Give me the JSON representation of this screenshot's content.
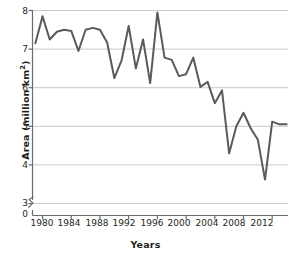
{
  "chart_data": {
    "type": "line",
    "title": "",
    "xlabel": "Years",
    "ylabel": "Area (million km²)",
    "ylabel_text": "Area (million km",
    "ylabel_sup": "2",
    "ylabel_tail": ")",
    "xlim": [
      1978.6,
      2014.2
    ],
    "ylim": [
      3.0,
      8.0
    ],
    "y_axis_break": true,
    "y_break_labels": [
      "3",
      "0"
    ],
    "grid": true,
    "grid_axis": "y",
    "legend": "none",
    "line_color": "#5a5a5a",
    "grid_color": "#c9c9c9",
    "axis_color": "#6b6b6b",
    "yticks": [
      8,
      7,
      6,
      5,
      4,
      3,
      0
    ],
    "ytick_labels": [
      "8",
      "7",
      "6",
      "5",
      "4",
      "3",
      "0"
    ],
    "xticks": [
      1980,
      1984,
      1988,
      1992,
      1996,
      2000,
      2004,
      2008,
      2012
    ],
    "xtick_labels": [
      "1980",
      "1984",
      "1988",
      "1992",
      "1996",
      "2000",
      "2004",
      "2008",
      "2012"
    ],
    "x": [
      1979,
      1980,
      1981,
      1982,
      1983,
      1984,
      1985,
      1986,
      1987,
      1988,
      1989,
      1990,
      1991,
      1992,
      1993,
      1994,
      1995,
      1996,
      1997,
      1998,
      1999,
      2000,
      2001,
      2002,
      2003,
      2004,
      2005,
      2006,
      2007,
      2008,
      2009,
      2010,
      2011,
      2012,
      2013,
      2014
    ],
    "values": [
      7.15,
      7.85,
      7.25,
      7.45,
      7.5,
      7.47,
      6.95,
      7.5,
      7.55,
      7.5,
      7.17,
      6.25,
      6.7,
      7.6,
      6.5,
      7.25,
      6.12,
      7.95,
      6.78,
      6.72,
      6.3,
      6.35,
      6.78,
      6.02,
      6.15,
      5.6,
      5.93,
      4.3,
      5.0,
      5.35,
      4.95,
      4.65,
      3.62,
      5.12,
      5.05,
      5.05
    ],
    "series_name": "Sea ice area",
    "units": "million km²"
  },
  "axis": {
    "y_title_label": "Area (million km2)",
    "x_title_label": "Years"
  }
}
